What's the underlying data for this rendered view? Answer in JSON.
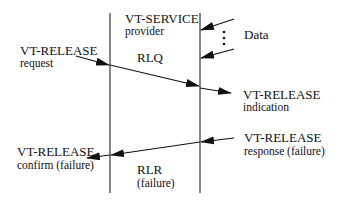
{
  "diagram": {
    "service_label": {
      "line1": "VT-SERVICE",
      "line2": "provider"
    },
    "data_label": "Data",
    "rlq_label": "RLQ",
    "rlr_label": {
      "line1": "RLR",
      "line2": "(failure)"
    },
    "release_request": {
      "line1": "VT-RELEASE",
      "line2": "request"
    },
    "release_indication": {
      "line1": "VT-RELEASE",
      "line2": "indication"
    },
    "release_response": {
      "line1": "VT-RELEASE",
      "line2": "response (failure)"
    },
    "release_confirm": {
      "line1": "VT-RELEASE",
      "line2": "confirm (failure)"
    },
    "colors": {
      "ink": "#111111",
      "background": "#ffffff"
    }
  }
}
